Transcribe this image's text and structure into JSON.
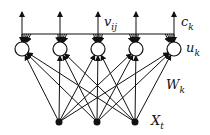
{
  "diagram": {
    "type": "neural-network",
    "labels": {
      "v": "v",
      "v_sub": "ij",
      "c": "c",
      "c_sub": "k",
      "u": "u",
      "u_sub": "k",
      "w": "W",
      "w_sub": "k",
      "x": "X",
      "x_sub": "t"
    },
    "hidden_nodes": [
      {
        "x": 22,
        "y": 49
      },
      {
        "x": 60,
        "y": 49
      },
      {
        "x": 98,
        "y": 49
      },
      {
        "x": 136,
        "y": 49
      },
      {
        "x": 174,
        "y": 49
      }
    ],
    "input_nodes": [
      {
        "x": 59,
        "y": 122
      },
      {
        "x": 97,
        "y": 122
      },
      {
        "x": 135,
        "y": 122
      }
    ],
    "colors": {
      "stroke": "#111111",
      "background": "#ffffff"
    }
  }
}
